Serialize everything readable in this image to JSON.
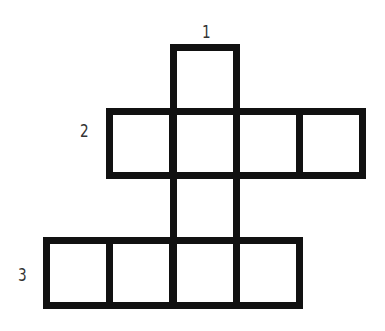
{
  "puzzle": {
    "type": "crossword-grid",
    "line_color": "#111111",
    "background": "#ffffff",
    "clue_numbers": [
      {
        "number": "1",
        "direction": "down",
        "x": 201,
        "y": 24
      },
      {
        "number": "2",
        "direction": "across",
        "x": 79,
        "y": 123
      },
      {
        "number": "3",
        "direction": "across",
        "x": 17,
        "y": 267
      }
    ],
    "cells": [
      {
        "row": 0,
        "col": 2
      },
      {
        "row": 1,
        "col": 1
      },
      {
        "row": 1,
        "col": 2
      },
      {
        "row": 1,
        "col": 3
      },
      {
        "row": 1,
        "col": 4
      },
      {
        "row": 2,
        "col": 2
      },
      {
        "row": 3,
        "col": 0
      },
      {
        "row": 3,
        "col": 1
      },
      {
        "row": 3,
        "col": 2
      },
      {
        "row": 3,
        "col": 3
      }
    ],
    "words": [
      {
        "number": "1",
        "direction": "down",
        "length": 4
      },
      {
        "number": "2",
        "direction": "across",
        "length": 4
      },
      {
        "number": "3",
        "direction": "across",
        "length": 4
      }
    ]
  }
}
